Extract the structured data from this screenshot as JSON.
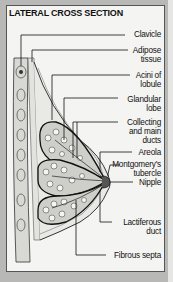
{
  "title": "LATERAL CROSS SECTION",
  "labels": {
    "clavicle": "Clavicle",
    "adipose_1": "Adipose",
    "adipose_2": "tissue",
    "acini_1": "Acini of",
    "acini_2": "lobule",
    "glandular_1": "Glandular",
    "glandular_2": "lobe",
    "collecting_1": "Collecting",
    "collecting_2": "and main",
    "collecting_3": "ducts",
    "areola": "Areola",
    "montgomery_1": "Montgomery's",
    "montgomery_2": "tubercle",
    "nipple": "Nipple",
    "lactiferous_1": "Lactiferous",
    "lactiferous_2": "duct",
    "fibrous": "Fibrous septa"
  },
  "colors": {
    "background": "#b8b8b6",
    "panel": "#f4f4f2",
    "ink": "#111111"
  }
}
